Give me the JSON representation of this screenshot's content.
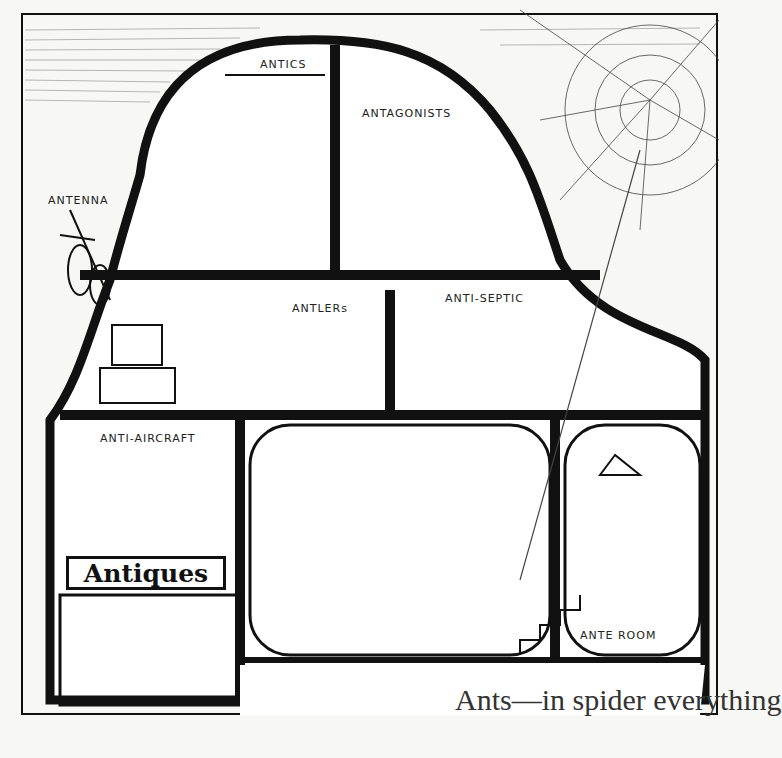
{
  "caption": "Ants—in spider everything",
  "rooms": {
    "antics": "ANTICS",
    "antagonists": "ANTAGONISTS",
    "antenna": "ANTENNA",
    "antlers": "ANTLERs",
    "antiseptic": "ANTI-SEPTIC",
    "antiaircraft": "ANTI-AIRCRAFT",
    "antiques": "Antiques",
    "anteroom": "ANTE ROOM"
  },
  "colors": {
    "ink": "#111111",
    "paper": "#f7f7f5"
  }
}
